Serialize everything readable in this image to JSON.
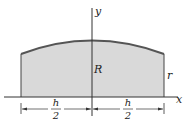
{
  "diagram": {
    "type": "geometry-figure",
    "axes": {
      "x_label": "x",
      "y_label": "y"
    },
    "labels": {
      "center_height": "R",
      "edge_height": "r",
      "half_width_left": {
        "numerator": "h",
        "denominator": "2"
      },
      "half_width_right": {
        "numerator": "h",
        "denominator": "2"
      }
    },
    "colors": {
      "fill": "#d9d9d9",
      "curve": "#555555",
      "lines": "#333333",
      "background": "#ffffff"
    }
  }
}
